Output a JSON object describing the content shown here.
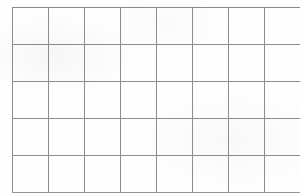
{
  "page": {
    "kind": "blank-grid-worksheet",
    "background_color": "#ffffff",
    "paper_color": "#fefefe"
  },
  "grid": {
    "columns": 8,
    "rows": 5,
    "cell_count": 40,
    "line_color": "#8e8e90",
    "line_width_px": 1,
    "cell_width_px": 35,
    "cell_height_px": 36,
    "left_px": 12,
    "top_px": 7,
    "right_px": 291,
    "bottom_px": 188,
    "total_width_px": 280,
    "total_height_px": 181,
    "cells": [
      [
        "",
        "",
        "",
        "",
        "",
        "",
        "",
        ""
      ],
      [
        "",
        "",
        "",
        "",
        "",
        "",
        "",
        ""
      ],
      [
        "",
        "",
        "",
        "",
        "",
        "",
        "",
        ""
      ],
      [
        "",
        "",
        "",
        "",
        "",
        "",
        "",
        ""
      ],
      [
        "",
        "",
        "",
        "",
        "",
        "",
        "",
        ""
      ]
    ]
  }
}
